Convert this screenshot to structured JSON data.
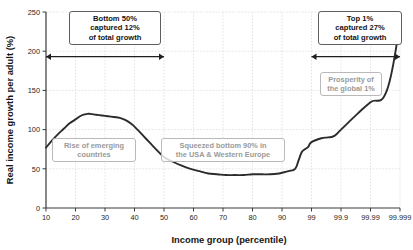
{
  "chart_data": {
    "type": "line",
    "title": "",
    "xlabel": "Income group (percentile)",
    "ylabel": "Real income growth per adult (%)",
    "ylim": [
      0,
      250
    ],
    "yticks": [
      0,
      50,
      100,
      150,
      200,
      250
    ],
    "ytick_labels": [
      "0",
      "50",
      "100",
      "150",
      "200",
      "250"
    ],
    "xtick_labels": [
      "10",
      "20",
      "30",
      "40",
      "50",
      "60",
      "70",
      "80",
      "90",
      "99",
      "99.9",
      "99.99",
      "99.999"
    ],
    "grid": true,
    "legend": "none",
    "series": [
      {
        "name": "Real income growth per adult",
        "x": [
          "10",
          "12",
          "14",
          "16",
          "18",
          "20",
          "22",
          "24",
          "25",
          "27",
          "29",
          "31",
          "33",
          "35",
          "37",
          "39",
          "41",
          "43",
          "45",
          "47",
          "50",
          "53",
          "56",
          "59",
          "62",
          "65",
          "68",
          "71",
          "74",
          "77",
          "80",
          "83",
          "86",
          "89",
          "90",
          "92",
          "94",
          "95",
          "96",
          "97",
          "98",
          "99",
          "99.3",
          "99.5",
          "99.7",
          "99.9",
          "99.95",
          "99.99",
          "99.995",
          "99.999"
        ],
        "values": [
          77,
          86,
          94,
          101,
          108,
          113,
          118,
          120,
          120,
          119,
          118,
          117,
          116,
          115,
          112,
          107,
          100,
          92,
          84,
          76,
          65,
          59,
          54,
          50,
          47,
          44,
          43,
          42,
          42,
          42,
          43,
          43,
          43,
          44,
          45,
          47,
          50,
          60,
          71,
          75,
          78,
          84,
          89,
          90,
          92,
          100,
          120,
          135,
          150,
          235
        ]
      }
    ],
    "annotations": [
      {
        "id": "bottom-50-callout",
        "lines": [
          "Bottom 50%",
          "captured 12%",
          "of total growth"
        ],
        "style": "dark"
      },
      {
        "id": "top-1-callout",
        "lines": [
          "Top 1%",
          "captured 27%",
          "of total growth"
        ],
        "style": "dark"
      },
      {
        "id": "rise-emerging-callout",
        "lines": [
          "Rise of emerging",
          "countries"
        ],
        "style": "gray"
      },
      {
        "id": "squeezed-callout",
        "lines": [
          "Squeezed bottom 90% in",
          "the USA & Western Europe"
        ],
        "style": "gray"
      },
      {
        "id": "prosperity-callout",
        "lines": [
          "Prosperity of",
          "the global 1%"
        ],
        "style": "gray"
      }
    ],
    "range_markers": [
      {
        "id": "bottom-50-range",
        "label_y_value": 193,
        "from_x": "10",
        "to_x": "50"
      },
      {
        "id": "top-1-range",
        "label_y_value": 193,
        "from_x": "99",
        "to_x": "99.999"
      }
    ],
    "colors": {
      "line": "#2b2b2b",
      "axis": "#3a3a3a",
      "grid": "#d8d8d8",
      "callout_dark_text": "#141414",
      "callout_gray_text": "#9a9a9a",
      "background": "#ffffff"
    }
  }
}
